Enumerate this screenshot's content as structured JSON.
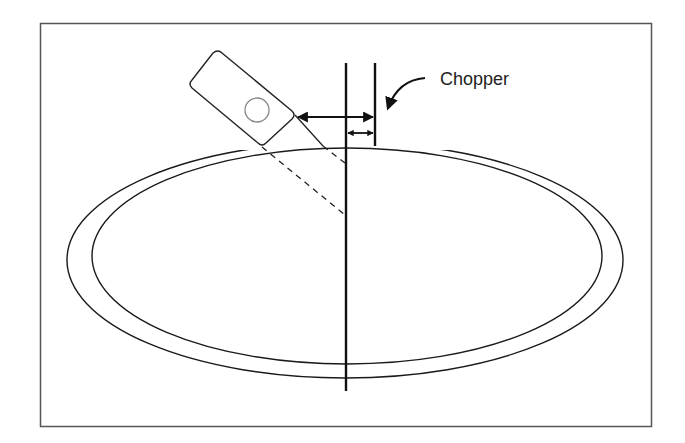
{
  "diagram": {
    "labels": {
      "chopper": "Chopper"
    },
    "colors": {
      "stroke": "#1a1a1a",
      "frame": "#555555",
      "circle": "#888888",
      "background": "#ffffff"
    },
    "components": [
      {
        "id": "sensor-device",
        "shape": "rotated-rounded-rectangle",
        "contains": "circle-lens"
      },
      {
        "id": "outer-ring",
        "shape": "ellipse-arc-broken-at-top"
      },
      {
        "id": "inner-ring",
        "shape": "ellipse"
      },
      {
        "id": "reference-line",
        "shape": "vertical-line"
      },
      {
        "id": "chopper-line",
        "shape": "vertical-line"
      },
      {
        "id": "distance-arrow-long",
        "shape": "double-arrow"
      },
      {
        "id": "distance-arrow-short",
        "shape": "double-arrow"
      },
      {
        "id": "beam-lines",
        "shape": "solid-and-dashed-lines"
      },
      {
        "id": "chopper-pointer",
        "shape": "curved-arrow"
      }
    ]
  }
}
